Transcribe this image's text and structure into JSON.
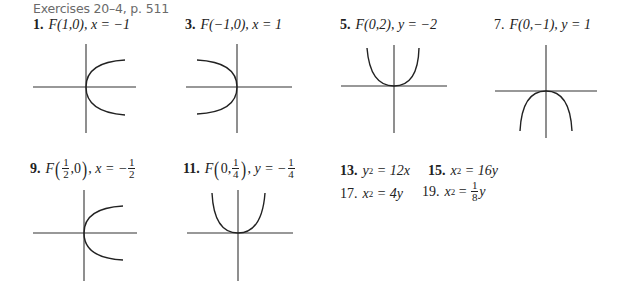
{
  "heading": "Exercises 20–4, p. 511",
  "exercises": [
    {
      "num": "1.",
      "focus": "F(1,0),",
      "directrix": "x = −1"
    },
    {
      "num": "3.",
      "focus": "F(−1,0),",
      "directrix": "x = 1"
    },
    {
      "num": "5.",
      "focus": "F(0,2),",
      "directrix": "y = −2"
    },
    {
      "num": "7.",
      "focus": "F(0,−1),",
      "directrix": "y = 1"
    },
    {
      "num": "9.",
      "focus_pre": "F",
      "focus_frac_num": "1",
      "focus_frac_den": "2",
      "focus_post": ",0",
      "directrix_pre": "x = −",
      "directrix_frac_num": "1",
      "directrix_frac_den": "2"
    },
    {
      "num": "11.",
      "focus_pre": "F",
      "focus_mid": "0,",
      "focus_frac_num": "1",
      "focus_frac_den": "4",
      "directrix_pre": "y = −",
      "directrix_frac_num": "1",
      "directrix_frac_den": "4"
    }
  ],
  "equations": [
    {
      "num": "13.",
      "lhs": "y",
      "exp": "2",
      "rhs": "= 12x"
    },
    {
      "num": "15.",
      "lhs": "x",
      "exp": "2",
      "rhs": "= 16y"
    },
    {
      "num": "17.",
      "lhs": "x",
      "exp": "2",
      "rhs": "= 4y"
    },
    {
      "num": "19.",
      "lhs": "x",
      "exp": "2",
      "rhs_pre": "=",
      "frac_num": "1",
      "frac_den": "8",
      "rhs_post": "y"
    }
  ],
  "graphs": [
    {
      "id": "1",
      "orientation": "opens-right"
    },
    {
      "id": "3",
      "orientation": "opens-left"
    },
    {
      "id": "5",
      "orientation": "opens-up"
    },
    {
      "id": "7",
      "orientation": "opens-down"
    },
    {
      "id": "9",
      "orientation": "opens-right"
    },
    {
      "id": "11",
      "orientation": "opens-up"
    }
  ]
}
